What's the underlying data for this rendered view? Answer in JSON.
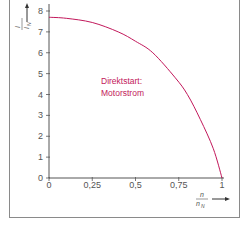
{
  "chart_data": {
    "type": "line",
    "title": "",
    "xlabel": "n / n_N",
    "ylabel": "I / I_N",
    "xlim": [
      0,
      1
    ],
    "ylim": [
      0,
      8
    ],
    "grid": false,
    "legend": null,
    "x_ticks": [
      "0",
      "0,25",
      "0,5",
      "0,75",
      "1"
    ],
    "y_ticks": [
      "0",
      "1",
      "2",
      "3",
      "4",
      "5",
      "6",
      "7",
      "8"
    ],
    "annotation": [
      "Direktstart:",
      "Motorstrom"
    ],
    "series": [
      {
        "name": "Direktstart: Motorstrom",
        "color": "#c2185b",
        "x": [
          0,
          0.1,
          0.25,
          0.4,
          0.5,
          0.6,
          0.73,
          0.8,
          0.875,
          0.95,
          1.0
        ],
        "y": [
          7.7,
          7.65,
          7.45,
          7.0,
          6.55,
          6.0,
          4.8,
          4.0,
          2.8,
          1.4,
          0
        ]
      }
    ]
  },
  "labels": {
    "y_num": "I",
    "y_den": "I",
    "y_den_sub": "N",
    "x_num": "n",
    "x_den": "n",
    "x_den_sub": "N",
    "annotation_line1": "Direktstart:",
    "annotation_line2": "Motorstrom"
  }
}
